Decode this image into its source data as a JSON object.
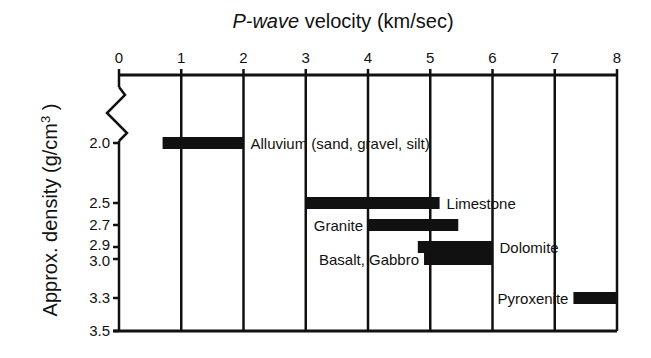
{
  "chart_data": {
    "type": "bar",
    "orientation": "horizontal-range",
    "title_italic": "P-wave",
    "title_rest": " velocity (km/sec)",
    "xlabel": "P-wave velocity (km/sec)",
    "ylabel": "Approx. density (g/cm³)",
    "ylabel_main": "Approx. density (g/cm",
    "ylabel_sup": "3",
    "ylabel_close": ")",
    "xlim": [
      0,
      8
    ],
    "x_ticks": [
      "0",
      "1",
      "2",
      "3",
      "4",
      "5",
      "6",
      "7",
      "8"
    ],
    "y_ticks": [
      "2.0",
      "2.5",
      "2.7",
      "2.9",
      "3.0",
      "3.3",
      "3.5"
    ],
    "y_tick_values": [
      2.0,
      2.5,
      2.7,
      2.9,
      3.0,
      3.3,
      3.5
    ],
    "axis_break": true,
    "grid": "vertical lines at each integer velocity",
    "series": [
      {
        "name": "Alluvium (sand, gravel, silt)",
        "density": 2.0,
        "vmin": 0.7,
        "vmax": 2.0,
        "label_side": "right"
      },
      {
        "name": "Limestone",
        "density": 2.5,
        "vmin": 3.0,
        "vmax": 5.15,
        "label_side": "right"
      },
      {
        "name": "Granite",
        "density": 2.7,
        "vmin": 4.0,
        "vmax": 5.45,
        "label_side": "left"
      },
      {
        "name": "Dolomite",
        "density": 2.9,
        "vmin": 4.8,
        "vmax": 6.0,
        "label_side": "right"
      },
      {
        "name": "Basalt, Gabbro",
        "density": 3.0,
        "vmin": 4.9,
        "vmax": 6.0,
        "label_side": "left"
      },
      {
        "name": "Pyroxenite",
        "density": 3.3,
        "vmin": 7.3,
        "vmax": 8.0,
        "label_side": "left"
      }
    ],
    "colors": {
      "bar": "#111111",
      "axis": "#111111",
      "background": "#ffffff"
    }
  }
}
